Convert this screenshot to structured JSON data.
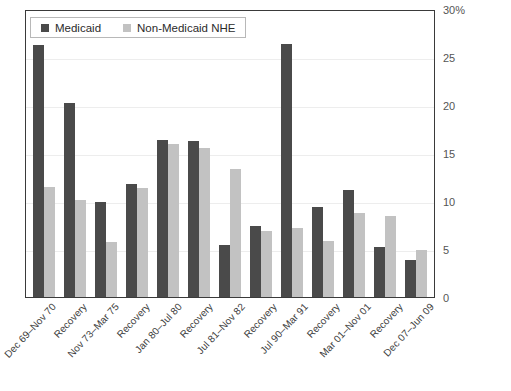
{
  "chart_data": {
    "type": "bar",
    "title": "",
    "xlabel": "",
    "ylabel": "",
    "ylim": [
      0,
      30
    ],
    "ytick_values": [
      0,
      5,
      10,
      15,
      20,
      25,
      30
    ],
    "ytick_labels": [
      "0",
      "5",
      "10",
      "15",
      "20",
      "25",
      "30%"
    ],
    "grid": true,
    "legend_position": "top-left",
    "categories": [
      "Dec 69–Nov 70",
      "Recovery",
      "Nov 73–Mar 75",
      "Recovery",
      "Jan 80–Jul 80",
      "Recovery",
      "Jul 81–Nov 82",
      "Recovery",
      "Jul 90–Mar 91",
      "Recovery",
      "Mar 01–Nov 01",
      "Recovery",
      "Dec 07–Jun 09"
    ],
    "series": [
      {
        "name": "Medicaid",
        "color": "#4a4a4a",
        "values": [
          26.3,
          20.2,
          9.9,
          11.8,
          16.4,
          16.3,
          5.4,
          7.4,
          26.4,
          9.4,
          11.1,
          5.2,
          3.9
        ]
      },
      {
        "name": "Non-Medicaid NHE",
        "color": "#c2c2c2",
        "values": [
          11.5,
          10.1,
          5.7,
          11.4,
          15.9,
          15.5,
          13.3,
          6.9,
          7.2,
          5.8,
          8.7,
          8.4,
          4.9
        ]
      }
    ]
  },
  "legend": {
    "entries": [
      {
        "label": "Medicaid",
        "swatch": "medicaid"
      },
      {
        "label": "Non-Medicaid NHE",
        "swatch": "nonmedicaid"
      }
    ]
  },
  "title_sliver": ""
}
